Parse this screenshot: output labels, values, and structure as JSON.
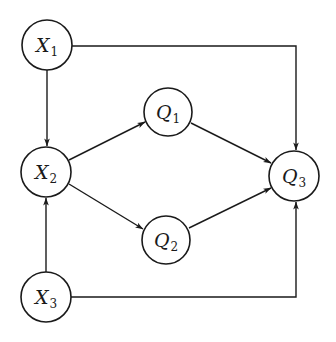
{
  "diagram": {
    "type": "directed-graph",
    "colors": {
      "stroke": "#1a1a1a",
      "background": "#ffffff"
    },
    "nodes": [
      {
        "id": "X1",
        "letter": "X",
        "sub": "1",
        "cx": 47,
        "cy": 45
      },
      {
        "id": "X2",
        "letter": "X",
        "sub": "2",
        "cx": 46,
        "cy": 172
      },
      {
        "id": "X3",
        "letter": "X",
        "sub": "3",
        "cx": 46,
        "cy": 297
      },
      {
        "id": "Q1",
        "letter": "Q",
        "sub": "1",
        "cx": 168,
        "cy": 112
      },
      {
        "id": "Q2",
        "letter": "Q",
        "sub": "2",
        "cx": 166,
        "cy": 240
      },
      {
        "id": "Q3",
        "letter": "Q",
        "sub": "3",
        "cx": 294,
        "cy": 176
      }
    ],
    "edges": [
      {
        "from": "X1",
        "to": "X2"
      },
      {
        "from": "X3",
        "to": "X2"
      },
      {
        "from": "X2",
        "to": "Q1"
      },
      {
        "from": "X2",
        "to": "Q2"
      },
      {
        "from": "Q1",
        "to": "Q3"
      },
      {
        "from": "Q2",
        "to": "Q3"
      },
      {
        "from": "X1",
        "to": "Q3",
        "routing": "right-then-down"
      },
      {
        "from": "X3",
        "to": "Q3",
        "routing": "right-then-up"
      }
    ]
  }
}
